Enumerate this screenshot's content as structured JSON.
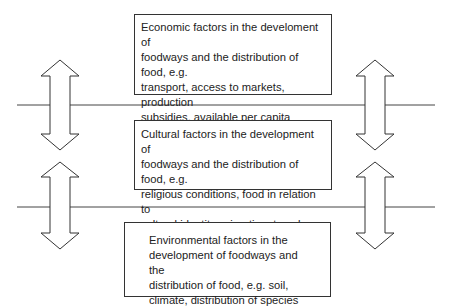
{
  "diagram": {
    "boxes": [
      {
        "id": "economic",
        "lines": [
          "Economic factors in the develoment of",
          "foodways and the distribution of food, e.g.",
          "transport, access to markets, production",
          "subsidies, available per capita income,",
          "intervention of government"
        ]
      },
      {
        "id": "cultural",
        "lines": [
          "Cultural factors in the development of",
          "foodways and the distribution of food, e.g.",
          "religious conditions, food in relation to",
          "cultural identity, migration, travel, fashion"
        ]
      },
      {
        "id": "environmental",
        "lines": [
          "Environmental factors in the",
          "development of foodways and the",
          "distribution of food, e.g. soil,",
          "climate, distribution of species"
        ]
      }
    ],
    "connectors": {
      "horizontal_lines": 2,
      "double_arrows": 4
    },
    "colors": {
      "stroke": "#333333",
      "background": "#ffffff",
      "text": "#222222"
    }
  }
}
